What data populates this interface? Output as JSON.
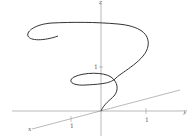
{
  "diagram": {
    "type": "3d-space-curve",
    "axes": {
      "x_label": "x",
      "y_label": "y",
      "z_label": "z"
    },
    "ticks": {
      "x_tick": "1",
      "y_tick": "1",
      "z_tick": "1"
    },
    "colors": {
      "curve": "#333333",
      "axes": "#888888",
      "background": "#ffffff"
    }
  }
}
